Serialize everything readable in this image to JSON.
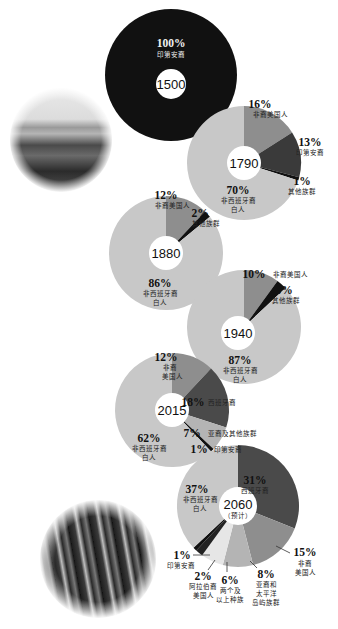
{
  "colors": {
    "white_hispanic_no": "#c8c8c8",
    "black": "#8e8e8e",
    "native": "#3a3a3a",
    "hispanic": "#4a4a4a",
    "other": "#111111",
    "asian": "#b4b4b4",
    "multi": "#e6e6e6",
    "arab": "#222222",
    "line": "#333333"
  },
  "chart_data": [
    {
      "type": "pie",
      "year": "1500",
      "center_label": "1500",
      "slices": [
        {
          "label": "印第安裔",
          "value": 100,
          "pct_label": "100%"
        }
      ]
    },
    {
      "type": "pie",
      "year": "1790",
      "center_label": "1790",
      "slices": [
        {
          "label": "非裔美国人",
          "value": 16,
          "pct_label": "16%"
        },
        {
          "label": "印第安裔",
          "value": 13,
          "pct_label": "13%"
        },
        {
          "label": "其他族群",
          "value": 1,
          "pct_label": "1%"
        },
        {
          "label": "非西班牙裔白人",
          "value": 70,
          "pct_label": "70%"
        }
      ]
    },
    {
      "type": "pie",
      "year": "1880",
      "center_label": "1880",
      "slices": [
        {
          "label": "非裔美国人",
          "value": 12,
          "pct_label": "12%"
        },
        {
          "label": "其他族群",
          "value": 2,
          "pct_label": "2%"
        },
        {
          "label": "非西班牙裔白人",
          "value": 86,
          "pct_label": "86%"
        }
      ]
    },
    {
      "type": "pie",
      "year": "1940",
      "center_label": "1940",
      "slices": [
        {
          "label": "非裔美国人",
          "value": 10,
          "pct_label": "10%"
        },
        {
          "label": "其他族群",
          "value": 3,
          "pct_label": "3%"
        },
        {
          "label": "非西班牙裔白人",
          "value": 87,
          "pct_label": "87%"
        }
      ]
    },
    {
      "type": "pie",
      "year": "2015",
      "center_label": "2015",
      "slices": [
        {
          "label": "非裔美国人",
          "value": 12,
          "pct_label": "12%"
        },
        {
          "label": "西班牙裔",
          "value": 18,
          "pct_label": "18%"
        },
        {
          "label": "亚裔及其他族群",
          "value": 7,
          "pct_label": "7%"
        },
        {
          "label": "印第安裔",
          "value": 1,
          "pct_label": "1%"
        },
        {
          "label": "非西班牙裔白人",
          "value": 62,
          "pct_label": "62%"
        }
      ]
    },
    {
      "type": "pie",
      "year": "2060",
      "center_label": "2060",
      "center_sub": "（预计）",
      "slices": [
        {
          "label": "西班牙裔",
          "value": 31,
          "pct_label": "31%"
        },
        {
          "label": "非裔美国人",
          "value": 15,
          "pct_label": "15%"
        },
        {
          "label": "亚裔和太平洋岛屿族群",
          "value": 8,
          "pct_label": "8%"
        },
        {
          "label": "两个及以上种族",
          "value": 6,
          "pct_label": "6%"
        },
        {
          "label": "阿拉伯裔美国人",
          "value": 2,
          "pct_label": "2%"
        },
        {
          "label": "印第安裔",
          "value": 1,
          "pct_label": "1%"
        },
        {
          "label": "非西班牙裔白人",
          "value": 37,
          "pct_label": "37%"
        }
      ]
    }
  ],
  "text": {
    "p1500": {
      "pct": "100%",
      "lbl": "印第安裔",
      "year": "1500"
    },
    "p1790": {
      "year": "1790",
      "black_pct": "16%",
      "black_lbl": "非裔美国人",
      "native_pct": "13%",
      "native_lbl": "印第安裔",
      "other_pct": "1%",
      "other_lbl": "其他族群",
      "white_pct": "70%",
      "white_lbl1": "非西班牙裔",
      "white_lbl2": "白人"
    },
    "p1880": {
      "year": "1880",
      "black_pct": "12%",
      "black_lbl": "非裔美国人",
      "other_pct": "2%",
      "other_lbl": "其他族群",
      "white_pct": "86%",
      "white_lbl1": "非西班牙裔",
      "white_lbl2": "白人"
    },
    "p1940": {
      "year": "1940",
      "black_pct": "10%",
      "black_lbl": "非裔美国人",
      "other_pct": "3%",
      "other_lbl": "其他族群",
      "white_pct": "87%",
      "white_lbl1": "非西班牙裔",
      "white_lbl2": "白人"
    },
    "p2015": {
      "year": "2015",
      "black_pct": "12%",
      "black_lbl1": "非裔",
      "black_lbl2": "美国人",
      "hisp_pct": "18%",
      "hisp_lbl": "西班牙裔",
      "asian_pct": "7%",
      "asian_lbl": "亚裔及其他族群",
      "native_pct": "1%",
      "native_lbl": "印第安裔",
      "white_pct": "62%",
      "white_lbl1": "非西班牙裔",
      "white_lbl2": "白人"
    },
    "p2060": {
      "year": "2060",
      "sub": "（预计）",
      "hisp_pct": "31%",
      "hisp_lbl": "西班牙裔",
      "white_pct": "37%",
      "white_lbl1": "非西班牙裔",
      "white_lbl2": "白人",
      "black_pct": "15%",
      "black_lbl1": "非裔",
      "black_lbl2": "美国人",
      "asian_pct": "8%",
      "asian_lbl1": "亚裔和",
      "asian_lbl2": "太平洋",
      "asian_lbl3": "岛屿族群",
      "multi_pct": "6%",
      "multi_lbl1": "两个及",
      "multi_lbl2": "以上种族",
      "arab_pct": "2%",
      "arab_lbl1": "阿拉伯裔",
      "arab_lbl2": "美国人",
      "native_pct": "1%",
      "native_lbl": "印第安裔"
    }
  },
  "photos": [
    {
      "name": "historic-settlement-photo"
    },
    {
      "name": "modern-crowd-photo"
    }
  ]
}
